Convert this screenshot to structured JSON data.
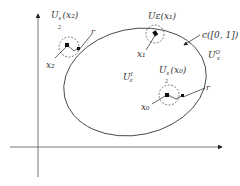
{
  "diagram": {
    "title": "",
    "axes": {
      "x_arrow": true,
      "y_arrow": true
    },
    "curve": {
      "label": "c([0, 1])"
    },
    "regions": {
      "inner": {
        "label_main": "U",
        "label_sup": "I",
        "label_sub": "ε"
      },
      "outer": {
        "label_main": "U",
        "label_sup": "O",
        "label_sub": "ε"
      }
    },
    "points": [
      {
        "id": "x0",
        "label": "x",
        "sub": "0",
        "neighborhood_label": "U",
        "neighborhood_sub": "ε/2",
        "neighborhood_arg": "(x0)"
      },
      {
        "id": "x1",
        "label": "x",
        "sub": "1",
        "neighborhood_label": "Uε(x1)"
      },
      {
        "id": "x2",
        "label": "x",
        "sub": "2",
        "neighborhood_label": "U",
        "neighborhood_sub": "ε/2",
        "neighborhood_arg": "(x2)"
      }
    ],
    "radius_label": "r",
    "text": {
      "u_eps2_x2": "U",
      "u_eps2_x2_sub": "ε",
      "u_eps2_x2_frac": "2",
      "u_eps2_x2_arg": "(x₂)",
      "u_eps_x1": "Uε(x₁)",
      "c_label": "c([0, 1])",
      "uo_main": "U",
      "uo_sup": "O",
      "uo_sub": "ε",
      "ui_main": "U",
      "ui_sup": "I",
      "ui_sub": "ε",
      "u_eps2_x0": "U",
      "u_eps2_x0_sub": "ε",
      "u_eps2_x0_frac": "2",
      "u_eps2_x0_arg": "(x₀)",
      "x0": "x₀",
      "x1": "x₁",
      "x2": "x₂",
      "r_top": "r",
      "r_bottom": "r"
    }
  }
}
